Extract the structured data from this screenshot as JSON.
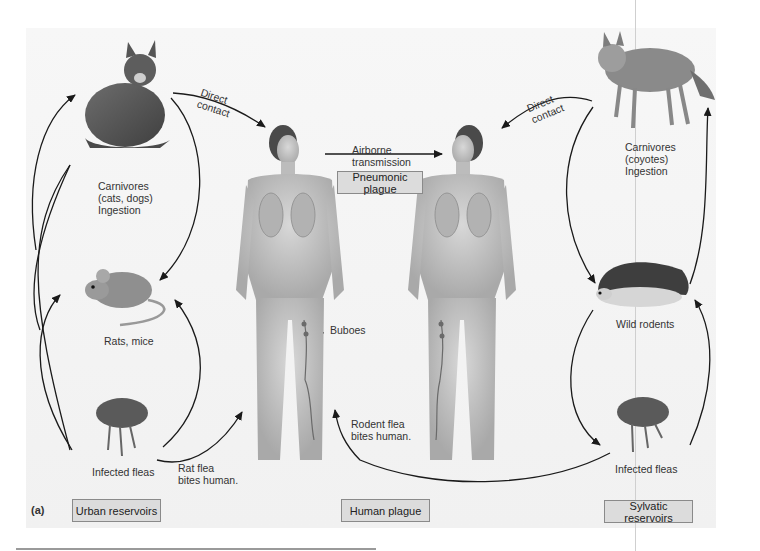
{
  "figure": {
    "panel_label": "(a)",
    "sections": {
      "urban": "Urban reservoirs",
      "human": "Human plague",
      "sylvatic": "Sylvatic reservoirs",
      "pneumonic": "Pneumonic plague"
    },
    "urban_cycle": {
      "carnivores": [
        "Carnivores",
        "(cats, dogs)",
        "Ingestion"
      ],
      "rodents": "Rats, mice",
      "fleas": "Infected fleas",
      "flea_bite": [
        "Rat flea",
        "bites human."
      ],
      "contact": [
        "Direct",
        "contact"
      ]
    },
    "sylvatic_cycle": {
      "carnivores": [
        "Carnivores",
        "(coyotes)",
        "Ingestion"
      ],
      "rodents": "Wild rodents",
      "fleas": "Infected fleas",
      "flea_bite": [
        "Rodent flea",
        "bites human."
      ],
      "contact": [
        "Direct",
        "contact"
      ]
    },
    "human": {
      "airborne": [
        "Airborne",
        "transmission"
      ],
      "buboes": "Buboes"
    },
    "icons": {
      "cat": "cat-illustration",
      "rat": "rat-illustration",
      "flea": "flea-illustration",
      "coyote": "coyote-illustration",
      "hedgehog": "wild-rodent-illustration",
      "human": "human-figure-illustration"
    },
    "colors": {
      "box_fill": "#dcdcdc",
      "box_border": "#8a8a8a",
      "arrow": "#1a1a1a",
      "background": "#f5f5f5"
    }
  }
}
